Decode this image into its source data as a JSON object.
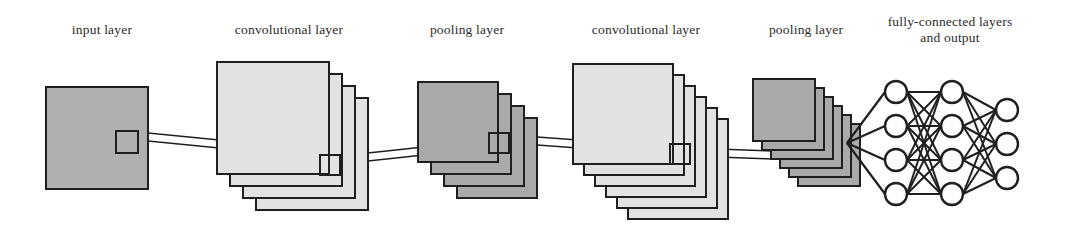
{
  "diagram": {
    "type": "cnn-architecture",
    "canvas": {
      "width": 1067,
      "height": 227,
      "background": "#ffffff"
    },
    "colors": {
      "input_fill": "#b0b0b0",
      "conv_fill": "#e2e2e2",
      "pool_fill": "#a9a9a9",
      "stroke": "#1f1f1f",
      "node_fill": "#ffffff",
      "label_color": "#2b2b2b",
      "background": "#ffffff"
    },
    "labels": [
      {
        "id": "label-input-layer",
        "text": "input layer",
        "x": 102,
        "y": 34,
        "lines": [
          "input layer"
        ]
      },
      {
        "id": "label-conv-layer-1",
        "text": "convolutional layer",
        "x": 289,
        "y": 34,
        "lines": [
          "convolutional layer"
        ]
      },
      {
        "id": "label-pool-layer-1",
        "text": "pooling layer",
        "x": 467,
        "y": 34,
        "lines": [
          "pooling layer"
        ]
      },
      {
        "id": "label-conv-layer-2",
        "text": "convolutional layer",
        "x": 646,
        "y": 34,
        "lines": [
          "convolutional layer"
        ]
      },
      {
        "id": "label-pool-layer-2",
        "text": "pooling layer",
        "x": 806,
        "y": 34,
        "lines": [
          "pooling layer"
        ]
      },
      {
        "id": "label-fc-layers",
        "text": "fully-connected layers and output",
        "x": 950,
        "y": 26,
        "lines": [
          "fully-connected layers",
          "and output"
        ]
      }
    ],
    "layers": [
      {
        "id": "input-layer",
        "name": "input layer",
        "kind": "input",
        "planes": 1,
        "plane_size": 102,
        "fill": "#b0b0b0",
        "origin": {
          "x": 46,
          "y": 87
        },
        "offset": {
          "x": 0,
          "y": 0
        },
        "receptive_field": {
          "x": 116,
          "y": 131,
          "w": 22,
          "h": 22
        }
      },
      {
        "id": "conv-layer-1",
        "name": "convolutional layer",
        "kind": "convolutional",
        "planes": 4,
        "plane_size": 112,
        "fill": "#e2e2e2",
        "origin": {
          "x": 217,
          "y": 62
        },
        "offset": {
          "x": 13,
          "y": 12
        },
        "receptive_field": {
          "x": 320,
          "y": 155,
          "w": 20,
          "h": 20
        }
      },
      {
        "id": "pool-layer-1",
        "name": "pooling layer",
        "kind": "pooling",
        "planes": 4,
        "plane_size": 80,
        "fill": "#a9a9a9",
        "origin": {
          "x": 418,
          "y": 82
        },
        "offset": {
          "x": 13,
          "y": 12
        },
        "receptive_field": {
          "x": 489,
          "y": 133,
          "w": 20,
          "h": 20
        }
      },
      {
        "id": "conv-layer-2",
        "name": "convolutional layer",
        "kind": "convolutional",
        "planes": 6,
        "plane_size": 100,
        "fill": "#e2e2e2",
        "origin": {
          "x": 573,
          "y": 64
        },
        "offset": {
          "x": 11,
          "y": 11
        },
        "receptive_field": {
          "x": 670,
          "y": 144,
          "w": 20,
          "h": 20
        }
      },
      {
        "id": "pool-layer-2",
        "name": "pooling layer",
        "kind": "pooling",
        "planes": 6,
        "plane_size": 62,
        "fill": "#a9a9a9",
        "origin": {
          "x": 753,
          "y": 79,
          "x2": 0
        },
        "offset": {
          "x": 9,
          "y": 9
        },
        "receptive_field": null
      }
    ],
    "fully_connected": {
      "id": "fc-network",
      "name": "fully-connected layers and output",
      "node_radius": 11,
      "fan_in_point": {
        "x": 847,
        "y": 143
      },
      "columns": [
        {
          "id": "fc-hidden-1",
          "x": 896,
          "node_count": 4,
          "ys": [
            92,
            126,
            160,
            194
          ]
        },
        {
          "id": "fc-hidden-2",
          "x": 952,
          "node_count": 4,
          "ys": [
            92,
            126,
            160,
            194
          ]
        },
        {
          "id": "fc-output",
          "x": 1007,
          "node_count": 3,
          "ys": [
            110,
            144,
            178
          ]
        }
      ]
    },
    "connectors": [
      {
        "id": "connector-input-to-conv1",
        "from": {
          "x": 138,
          "y": 136
        },
        "to": {
          "x": 270,
          "y": 149
        },
        "spread": 8
      },
      {
        "id": "connector-conv1-to-pool1",
        "from": {
          "x": 340,
          "y": 160
        },
        "to": {
          "x": 470,
          "y": 146
        },
        "spread": 8
      },
      {
        "id": "connector-pool1-to-conv2",
        "from": {
          "x": 509,
          "y": 139
        },
        "to": {
          "x": 633,
          "y": 148
        },
        "spread": 8
      },
      {
        "id": "connector-conv2-to-pool2",
        "from": {
          "x": 690,
          "y": 152
        },
        "to": {
          "x": 800,
          "y": 156
        },
        "spread": 8
      }
    ]
  }
}
